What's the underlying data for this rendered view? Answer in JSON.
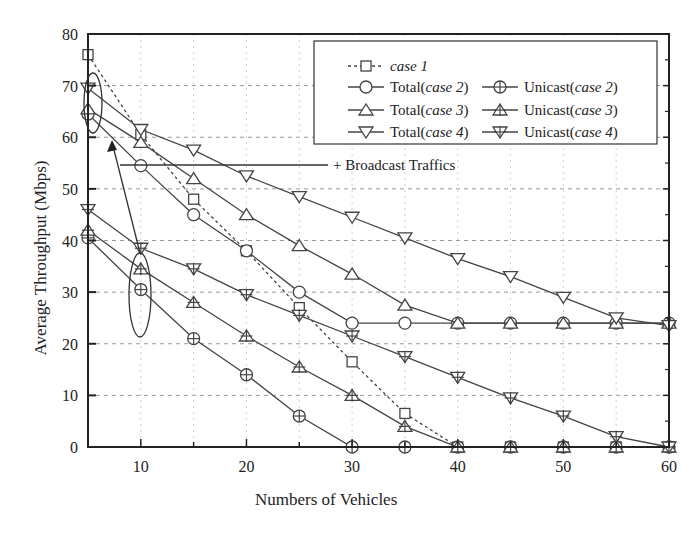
{
  "chart_data": {
    "type": "line",
    "title": "",
    "xlabel": "Numbers of Vehicles",
    "ylabel": "Average Throughput (Mbps)",
    "xlim": [
      5,
      60
    ],
    "ylim": [
      0,
      80
    ],
    "xticks": [
      10,
      20,
      30,
      40,
      50,
      60
    ],
    "yticks": [
      0,
      10,
      20,
      30,
      40,
      50,
      60,
      70,
      80
    ],
    "grid": true,
    "legend_position": "upper right",
    "x": [
      5,
      10,
      15,
      20,
      25,
      30,
      35,
      40,
      45,
      50,
      55,
      60
    ],
    "series": [
      {
        "name": "case 1",
        "marker": "square",
        "style": "dashed",
        "values": [
          76,
          60.5,
          48,
          38,
          27,
          16.5,
          6.5,
          0,
          0,
          0,
          0,
          0
        ]
      },
      {
        "name": "Total(case 2)",
        "marker": "circle",
        "style": "solid",
        "values": [
          64.5,
          54.5,
          45,
          38,
          30,
          24,
          24,
          24,
          24,
          24,
          24,
          24
        ]
      },
      {
        "name": "Unicast(case 2)",
        "marker": "circle-plus",
        "style": "solid",
        "values": [
          40.5,
          30.5,
          21,
          14,
          6,
          0,
          0,
          0,
          0,
          0,
          0,
          0
        ]
      },
      {
        "name": "Total(case 3)",
        "marker": "triangle-up",
        "style": "solid",
        "values": [
          65.5,
          59,
          52,
          45,
          39,
          33.5,
          27.5,
          24,
          24,
          24,
          24,
          24
        ]
      },
      {
        "name": "Unicast(case 3)",
        "marker": "triangle-up-plus",
        "style": "solid",
        "values": [
          42,
          34.5,
          28,
          21.5,
          15.5,
          10,
          4,
          0,
          0,
          0,
          0,
          0
        ]
      },
      {
        "name": "Total(case 4)",
        "marker": "triangle-down",
        "style": "solid",
        "values": [
          69.5,
          61.5,
          57.5,
          52.5,
          48.5,
          44.5,
          40.5,
          36.5,
          33,
          29,
          25,
          23.5
        ]
      },
      {
        "name": "Unicast(case 4)",
        "marker": "triangle-down-plus",
        "style": "solid",
        "values": [
          46,
          38.5,
          34.5,
          29.5,
          25.5,
          21.5,
          17.5,
          13.5,
          9.5,
          6,
          2,
          0
        ]
      }
    ],
    "annotations": [
      {
        "text": "+ Broadcast Traffics",
        "points_to": "gap between Total and Unicast lines at 10 vehicles"
      }
    ]
  },
  "legend": {
    "case1": "case 1",
    "total_prefix": "Total",
    "unicast_prefix": "Unicast",
    "case2": "case 2",
    "case3": "case 3",
    "case4": "case 4"
  },
  "annotation": {
    "text": "+ Broadcast Traffics"
  },
  "colors": {
    "line": "#444444",
    "grid": "#999999",
    "axis": "#222222"
  }
}
